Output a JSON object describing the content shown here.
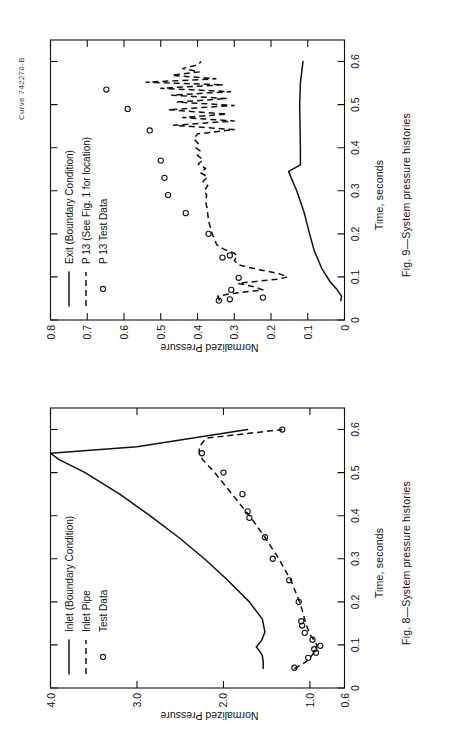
{
  "page": {
    "curve_id": "Curve 742270-B",
    "background": "#ffffff",
    "ink": "#111111"
  },
  "figures": [
    {
      "key": "fig8",
      "caption": "Fig. 8—System pressure histories",
      "chart_data": {
        "type": "line",
        "title": "",
        "xlabel": "Time, seconds",
        "ylabel": "Normalized Pressure",
        "xlim": [
          0,
          0.65
        ],
        "ylim": [
          0.6,
          4.0
        ],
        "grid": false,
        "legend_position": "inside-upper-left",
        "xticks": [
          0,
          0.1,
          0.2,
          0.3,
          0.4,
          0.5,
          0.6
        ],
        "xticklabels": [
          "0",
          "0.1",
          "0.2",
          "0.3",
          "0.4",
          "0.5",
          "0.6"
        ],
        "yticks": [
          0.6,
          1.0,
          2.0,
          3.0,
          4.0
        ],
        "yticklabels": [
          "0.6",
          "1.0",
          "2.0",
          "3.0",
          "4.0"
        ],
        "series": [
          {
            "name": "Inlet (Boundary Condition)",
            "style": "solid",
            "x": [
              0.045,
              0.06,
              0.075,
              0.085,
              0.095,
              0.11,
              0.13,
              0.16,
              0.2,
              0.25,
              0.3,
              0.35,
              0.4,
              0.45,
              0.5,
              0.53,
              0.545,
              0.56,
              0.6
            ],
            "y": [
              1.54,
              1.54,
              1.55,
              1.58,
              1.62,
              1.56,
              1.52,
              1.55,
              1.7,
              1.95,
              2.22,
              2.52,
              2.85,
              3.2,
              3.6,
              3.9,
              4.0,
              3.0,
              1.72
            ]
          },
          {
            "name": "Inlet Pipe",
            "style": "dashed",
            "x": [
              0.045,
              0.06,
              0.07,
              0.08,
              0.09,
              0.1,
              0.11,
              0.125,
              0.15,
              0.175,
              0.2,
              0.25,
              0.3,
              0.35,
              0.4,
              0.45,
              0.5,
              0.53,
              0.545,
              0.56,
              0.58,
              0.6
            ],
            "y": [
              1.18,
              1.05,
              1.0,
              0.96,
              0.93,
              0.92,
              0.95,
              1.0,
              1.05,
              1.08,
              1.12,
              1.22,
              1.36,
              1.52,
              1.7,
              1.9,
              2.1,
              2.24,
              2.28,
              2.28,
              2.2,
              1.32
            ]
          },
          {
            "name": "Test Data",
            "style": "points",
            "x": [
              0.047,
              0.07,
              0.082,
              0.09,
              0.098,
              0.112,
              0.128,
              0.145,
              0.155,
              0.2,
              0.25,
              0.3,
              0.35,
              0.395,
              0.41,
              0.45,
              0.5,
              0.545,
              0.6
            ],
            "y": [
              1.18,
              1.02,
              0.93,
              0.95,
              0.88,
              0.97,
              1.06,
              1.09,
              1.1,
              1.13,
              1.24,
              1.43,
              1.52,
              1.7,
              1.72,
              1.78,
              2.0,
              2.25,
              1.32
            ]
          }
        ]
      }
    },
    {
      "key": "fig9",
      "caption": "Fig. 9—System pressure histories",
      "chart_data": {
        "type": "line",
        "title": "",
        "xlabel": "Time, seconds",
        "ylabel": "Normalized Pressure",
        "xlim": [
          0,
          0.65
        ],
        "ylim": [
          0,
          0.8
        ],
        "grid": false,
        "legend_position": "inside-upper-left",
        "xticks": [
          0,
          0.1,
          0.2,
          0.3,
          0.4,
          0.5,
          0.6
        ],
        "xticklabels": [
          "0",
          "0.1",
          "0.2",
          "0.3",
          "0.4",
          "0.5",
          "0.6"
        ],
        "yticks": [
          0,
          0.1,
          0.2,
          0.3,
          0.4,
          0.5,
          0.6,
          0.7,
          0.8
        ],
        "yticklabels": [
          "0",
          "0.1",
          "0.2",
          "0.3",
          "0.4",
          "0.5",
          "0.6",
          "0.7",
          "0.8"
        ],
        "series": [
          {
            "name": "Exit (Boundary Condition)",
            "style": "solid",
            "x": [
              0.045,
              0.055,
              0.07,
              0.09,
              0.12,
              0.16,
              0.2,
              0.25,
              0.3,
              0.33,
              0.345,
              0.36,
              0.4,
              0.45,
              0.5,
              0.55,
              0.6
            ],
            "y": [
              0.01,
              0.008,
              0.02,
              0.04,
              0.062,
              0.082,
              0.095,
              0.11,
              0.13,
              0.145,
              0.152,
              0.12,
              0.12,
              0.121,
              0.122,
              0.12,
              0.113
            ]
          },
          {
            "name": "P 13 (See Fig. 1 for location)",
            "style": "dashed",
            "x": [
              0.045,
              0.055,
              0.06,
              0.07,
              0.078,
              0.085,
              0.095,
              0.1,
              0.108,
              0.118,
              0.128,
              0.138,
              0.148,
              0.155,
              0.165,
              0.175,
              0.185,
              0.2,
              0.215,
              0.23,
              0.245,
              0.26,
              0.275,
              0.29,
              0.3,
              0.312,
              0.322,
              0.332,
              0.342,
              0.352,
              0.362,
              0.372,
              0.382,
              0.392,
              0.4,
              0.41,
              0.42,
              0.432,
              0.442,
              0.452,
              0.462,
              0.47,
              0.478,
              0.488,
              0.498,
              0.506,
              0.514,
              0.522,
              0.53,
              0.538,
              0.546,
              0.552,
              0.56,
              0.568,
              0.576,
              0.584,
              0.592,
              0.6
            ],
            "y": [
              0.34,
              0.345,
              0.318,
              0.222,
              0.25,
              0.29,
              0.18,
              0.155,
              0.18,
              0.24,
              0.288,
              0.3,
              0.292,
              0.3,
              0.33,
              0.348,
              0.352,
              0.36,
              0.365,
              0.37,
              0.372,
              0.374,
              0.378,
              0.375,
              0.382,
              0.372,
              0.385,
              0.372,
              0.392,
              0.378,
              0.398,
              0.385,
              0.4,
              0.392,
              0.405,
              0.398,
              0.41,
              0.4,
              0.3,
              0.465,
              0.3,
              0.44,
              0.32,
              0.48,
              0.3,
              0.455,
              0.32,
              0.47,
              0.31,
              0.5,
              0.33,
              0.54,
              0.35,
              0.47,
              0.395,
              0.44,
              0.4,
              0.39
            ]
          },
          {
            "name": "P 13 Test Data",
            "style": "points",
            "x": [
              0.045,
              0.048,
              0.052,
              0.07,
              0.098,
              0.145,
              0.15,
              0.2,
              0.248,
              0.29,
              0.33,
              0.37,
              0.44,
              0.49,
              0.535
            ],
            "y": [
              0.342,
              0.312,
              0.222,
              0.308,
              0.288,
              0.332,
              0.312,
              0.37,
              0.432,
              0.48,
              0.49,
              0.5,
              0.53,
              0.59,
              0.648
            ]
          }
        ]
      }
    }
  ]
}
